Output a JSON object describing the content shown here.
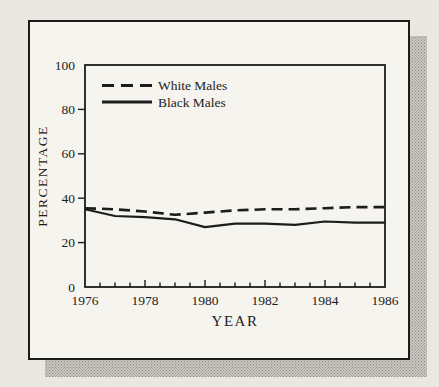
{
  "figure": {
    "ink_color": "#1c1c1c",
    "panel_background": "#f6f4ef",
    "page_background": "#ebe8e2",
    "shadow_color": "#c9c6c0"
  },
  "chart_data": {
    "type": "line",
    "title": "",
    "xlabel": "YEAR",
    "ylabel": "PERCENTAGE",
    "xlim": [
      1976,
      1986
    ],
    "ylim": [
      0,
      100
    ],
    "grid": false,
    "legend_position": "inside-top-left",
    "x": [
      1976,
      1977,
      1978,
      1979,
      1980,
      1981,
      1982,
      1983,
      1984,
      1985,
      1986
    ],
    "y_ticks": [
      0,
      20,
      40,
      60,
      80,
      100
    ],
    "x_tick_labels": [
      1976,
      1978,
      1980,
      1982,
      1984,
      1986
    ],
    "x_minor_tick_step": 0.5,
    "series": [
      {
        "name": "White Males",
        "style": "dashed",
        "color": "#1c1c1c",
        "values": [
          35.5,
          35,
          34,
          32.5,
          33.5,
          34.5,
          35,
          35,
          35.5,
          36,
          36
        ]
      },
      {
        "name": "Black Males",
        "style": "solid",
        "color": "#1c1c1c",
        "values": [
          35,
          32,
          31.5,
          30.5,
          27,
          28.5,
          28.5,
          28,
          29.5,
          29,
          29
        ]
      }
    ]
  }
}
